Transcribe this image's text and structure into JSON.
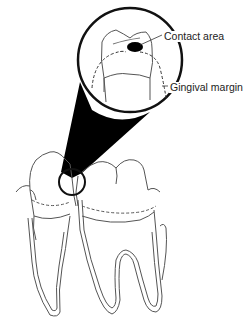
{
  "figure": {
    "labels": {
      "contact_area": "Contact area",
      "gingival_margin": "Gingival margin"
    },
    "colors": {
      "line": "#555555",
      "outline": "#111111",
      "contact_fill": "#000000",
      "background": "#ffffff"
    }
  }
}
